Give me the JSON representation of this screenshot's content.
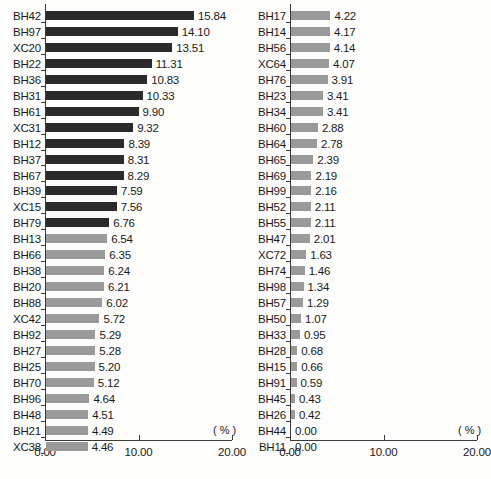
{
  "chart_data": [
    {
      "type": "bar",
      "orientation": "horizontal",
      "panel": "left",
      "title": "",
      "xlabel": "( % )",
      "ylabel": "",
      "xlim": [
        0.0,
        20.0
      ],
      "xticks": [
        0.0,
        10.0,
        20.0
      ],
      "xtick_labels": [
        "0.00",
        "10.00",
        "20.00"
      ],
      "grid": false,
      "legend": "none",
      "categories": [
        "BH42",
        "BH97",
        "XC20",
        "BH22",
        "BH36",
        "BH31",
        "BH61",
        "XC31",
        "BH12",
        "BH37",
        "BH67",
        "BH39",
        "XC15",
        "BH79",
        "BH13",
        "BH66",
        "BH38",
        "BH20",
        "BH88",
        "XC42",
        "BH92",
        "BH27",
        "BH25",
        "BH70",
        "BH96",
        "BH48",
        "BH21",
        "XC38"
      ],
      "values": [
        15.84,
        14.1,
        13.51,
        11.31,
        10.83,
        10.33,
        9.9,
        9.32,
        8.39,
        8.31,
        8.29,
        7.59,
        7.56,
        6.76,
        6.54,
        6.35,
        6.24,
        6.21,
        6.02,
        5.72,
        5.29,
        5.28,
        5.2,
        5.12,
        4.64,
        4.51,
        4.49,
        4.46
      ],
      "value_labels": [
        "15.84",
        "14.10",
        "13.51",
        "11.31",
        "10.83",
        "10.33",
        "9.90",
        "9.32",
        "8.39",
        "8.31",
        "8.29",
        "7.59",
        "7.56",
        "6.76",
        "6.54",
        "6.35",
        "6.24",
        "6.21",
        "6.02",
        "5.72",
        "5.29",
        "5.28",
        "5.20",
        "5.12",
        "4.64",
        "4.51",
        "4.49",
        "4.46"
      ],
      "bar_colors": [
        "#2b2b2b",
        "#2b2b2b",
        "#2b2b2b",
        "#2b2b2b",
        "#2b2b2b",
        "#2b2b2b",
        "#2b2b2b",
        "#2b2b2b",
        "#2b2b2b",
        "#2b2b2b",
        "#2b2b2b",
        "#2b2b2b",
        "#2b2b2b",
        "#2b2b2b",
        "#9a9a9a",
        "#9a9a9a",
        "#9a9a9a",
        "#9a9a9a",
        "#9a9a9a",
        "#9a9a9a",
        "#9a9a9a",
        "#9a9a9a",
        "#9a9a9a",
        "#9a9a9a",
        "#9a9a9a",
        "#9a9a9a",
        "#9a9a9a",
        "#9a9a9a"
      ]
    },
    {
      "type": "bar",
      "orientation": "horizontal",
      "panel": "right",
      "title": "",
      "xlabel": "( % )",
      "ylabel": "",
      "xlim": [
        0.0,
        20.0
      ],
      "xticks": [
        0.0,
        10.0,
        20.0
      ],
      "xtick_labels": [
        "0.00",
        "10.00",
        "20.00"
      ],
      "grid": false,
      "legend": "none",
      "categories": [
        "BH17",
        "BH14",
        "BH56",
        "XC64",
        "BH76",
        "BH23",
        "BH34",
        "BH60",
        "BH64",
        "BH65",
        "BH69",
        "BH99",
        "BH52",
        "BH55",
        "BH47",
        "XC72",
        "BH74",
        "BH98",
        "BH57",
        "BH50",
        "BH33",
        "BH28",
        "BH15",
        "BH91",
        "BH45",
        "BH26",
        "BH44",
        "BH11"
      ],
      "values": [
        4.22,
        4.17,
        4.14,
        4.07,
        3.91,
        3.41,
        3.41,
        2.88,
        2.78,
        2.39,
        2.19,
        2.16,
        2.11,
        2.11,
        2.01,
        1.63,
        1.46,
        1.34,
        1.29,
        1.07,
        0.95,
        0.68,
        0.66,
        0.59,
        0.43,
        0.42,
        0.0,
        0.0
      ],
      "value_labels": [
        "4.22",
        "4.17",
        "4.14",
        "4.07",
        "3.91",
        "3.41",
        "3.41",
        "2.88",
        "2.78",
        "2.39",
        "2.19",
        "2.16",
        "2.11",
        "2.11",
        "2.01",
        "1.63",
        "1.46",
        "1.34",
        "1.29",
        "1.07",
        "0.95",
        "0.68",
        "0.66",
        "0.59",
        "0.43",
        "0.42",
        "0.00",
        "0.00"
      ],
      "bar_colors": [
        "#9a9a9a",
        "#9a9a9a",
        "#9a9a9a",
        "#9a9a9a",
        "#9a9a9a",
        "#9a9a9a",
        "#9a9a9a",
        "#9a9a9a",
        "#9a9a9a",
        "#9a9a9a",
        "#9a9a9a",
        "#9a9a9a",
        "#9a9a9a",
        "#9a9a9a",
        "#9a9a9a",
        "#9a9a9a",
        "#9a9a9a",
        "#9a9a9a",
        "#9a9a9a",
        "#9a9a9a",
        "#9a9a9a",
        "#9a9a9a",
        "#9a9a9a",
        "#9a9a9a",
        "#9a9a9a",
        "#9a9a9a",
        "#9a9a9a",
        "#9a9a9a"
      ]
    }
  ]
}
